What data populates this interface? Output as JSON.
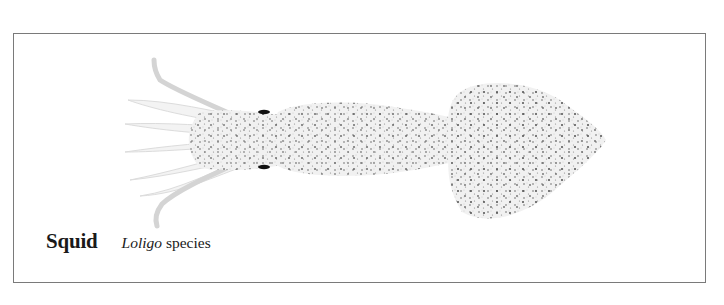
{
  "illustration": {
    "subject": "squid",
    "colors": {
      "body_fill": "#ececec",
      "speckle": "#4a4a4a",
      "eye": "#111111",
      "frame": "#7a7a7a"
    }
  },
  "caption": {
    "common_name": "Squid",
    "genus": "Loligo",
    "species_word": "species"
  }
}
